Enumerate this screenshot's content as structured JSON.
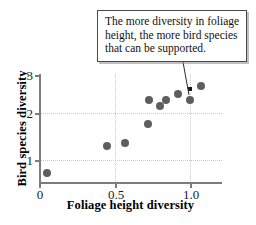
{
  "chart_data": {
    "type": "scatter",
    "title": "",
    "xlabel": "Foliage height diversity",
    "ylabel": "Bird species diversity",
    "xlim": [
      0,
      1.2
    ],
    "ylim": [
      0,
      3.2
    ],
    "xticks": [
      "0",
      "0.5",
      "1.0"
    ],
    "xtick_values": [
      0,
      0.5,
      1.0
    ],
    "yticks": [
      "1",
      "2",
      "3"
    ],
    "ytick_values": [
      1,
      2,
      3
    ],
    "grid": true,
    "legend": null,
    "points": [
      {
        "x": 0.05,
        "y": 0.73
      },
      {
        "x": 0.45,
        "y": 1.29
      },
      {
        "x": 0.57,
        "y": 1.37
      },
      {
        "x": 0.72,
        "y": 1.77
      },
      {
        "x": 0.73,
        "y": 2.28
      },
      {
        "x": 0.8,
        "y": 2.14
      },
      {
        "x": 0.84,
        "y": 2.28
      },
      {
        "x": 0.92,
        "y": 2.41
      },
      {
        "x": 1.0,
        "y": 2.28
      },
      {
        "x": 1.07,
        "y": 2.57
      }
    ],
    "highlighted_point": {
      "x": 1.0,
      "y": 2.52
    },
    "annotations": [
      {
        "text": "The more diversity in foliage height, the more bird species that can be supported.",
        "lines": [
          "The more diversity in foliage",
          "height, the more bird species",
          "that can be supported."
        ],
        "target": {
          "x": 1.0,
          "y": 2.52
        }
      }
    ],
    "colors": {
      "point": "#5e5e5e",
      "axis": "#7c7c7c",
      "grid": "#c9c9c9",
      "text": "#111111",
      "callout_border": "#4a4a4a",
      "callout_background": "#ffffff"
    }
  }
}
